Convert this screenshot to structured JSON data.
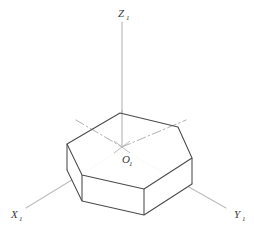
{
  "figure": {
    "background_color": "#ffffff",
    "width": 254,
    "height": 231
  },
  "labels": {
    "z_axis": {
      "base": "Z",
      "sub": "1",
      "x": 121,
      "y": 14
    },
    "x_axis": {
      "base": "X",
      "sub": "1",
      "x": 14,
      "y": 215
    },
    "y_axis": {
      "base": "Y",
      "sub": "1",
      "x": 236,
      "y": 215
    },
    "origin": {
      "base": "O",
      "sub": "1",
      "x": 126,
      "y": 159
    }
  },
  "colors": {
    "axis_stroke": "#b6b6b6",
    "edge_stroke": "#4a4a4a",
    "edge_stroke_light": "#7d7d7d",
    "dashdot_stroke": "#b0b0b0",
    "label_fill": "#3a3a3a",
    "face_fill": "#ffffff"
  },
  "geometry": {
    "origin": {
      "x": 122,
      "y": 147
    },
    "axes": [
      {
        "name": "z-axis",
        "x1": 122,
        "y1": 147,
        "x2": 122,
        "y2": 22
      },
      {
        "name": "x-axis",
        "x1": 122,
        "y1": 147,
        "x2": 26,
        "y2": 208
      },
      {
        "name": "y-axis",
        "x1": 122,
        "y1": 147,
        "x2": 226,
        "y2": 208
      }
    ],
    "top_hexagon": [
      {
        "x": 120,
        "y": 113
      },
      {
        "x": 178,
        "y": 127
      },
      {
        "x": 192,
        "y": 158
      },
      {
        "x": 144,
        "y": 189
      },
      {
        "x": 82,
        "y": 175
      },
      {
        "x": 67,
        "y": 144
      }
    ],
    "prism_height": 26,
    "dashdot_segments": [
      {
        "name": "diag-left",
        "x1": 80,
        "y1": 123,
        "x2": 122,
        "y2": 147
      },
      {
        "name": "diag-right",
        "x1": 122,
        "y1": 147,
        "x2": 178,
        "y2": 122
      }
    ],
    "origin_cross": [
      {
        "x1": 114,
        "y1": 141,
        "x2": 130,
        "y2": 153
      },
      {
        "x1": 114,
        "y1": 153,
        "x2": 130,
        "y2": 141
      }
    ]
  }
}
